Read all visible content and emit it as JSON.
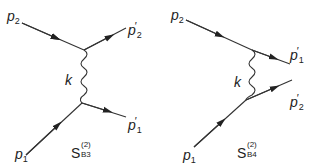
{
  "diagrams": [
    {
      "id": "B3",
      "labels": {
        "p_in_top": "p",
        "p_in_top_sub": "2",
        "p_out_top": "p",
        "p_out_top_sub": "2",
        "p_out_top_prime": "′",
        "p_in_bottom": "p",
        "p_in_bottom_sub": "1",
        "p_out_bottom": "p",
        "p_out_bottom_sub": "1",
        "p_out_bottom_prime": "′",
        "propagator": "k",
        "name_main": "S",
        "name_sup": "(2)",
        "name_sub": "B3"
      }
    },
    {
      "id": "B4",
      "labels": {
        "p_in_top": "p",
        "p_in_top_sub": "2",
        "p_out_top": "p",
        "p_out_top_sub": "1",
        "p_out_top_prime": "′",
        "p_in_bottom": "p",
        "p_in_bottom_sub": "1",
        "p_out_bottom": "p",
        "p_out_bottom_sub": "2",
        "p_out_bottom_prime": "′",
        "propagator": "k",
        "name_main": "S",
        "name_sup": "(2)",
        "name_sub": "B4"
      }
    }
  ],
  "colors": {
    "line": "#333333",
    "text": "#222222"
  }
}
